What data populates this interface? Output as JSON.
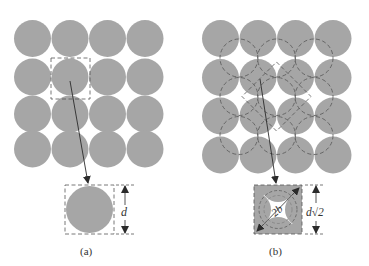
{
  "figure": {
    "panels": [
      {
        "id": "a",
        "caption": "(a)",
        "description": "Square array of touching fibers; unit cell of width d",
        "dimension_label": "d",
        "grid": {
          "rows": 4,
          "cols": 4,
          "origin_x": 14,
          "origin_y": 20,
          "pitch_x": 37.5,
          "pitch_y": 37.5,
          "radius": 18.5
        }
      },
      {
        "id": "b",
        "caption": "(b)",
        "description": "Square array with interstitial dashed circles; rotated unit cell of width d√2",
        "dimension_label": "d√2",
        "diagonal_label": "2b",
        "grid": {
          "rows": 4,
          "cols": 4,
          "origin_x": 202,
          "origin_y": 20,
          "pitch_x": 37.5,
          "pitch_y": 38.5,
          "radius": 18.5
        }
      }
    ],
    "colors": {
      "fiber_fill": "#a6a6a6",
      "line": "#2b2b2b",
      "dash": "#555555",
      "background": "#ffffff"
    }
  }
}
